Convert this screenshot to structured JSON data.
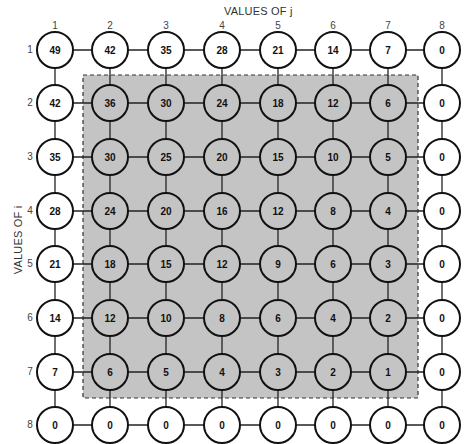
{
  "j_axis": {
    "title": "VALUES OF j",
    "ticks": [
      "1",
      "2",
      "3",
      "4",
      "5",
      "6",
      "7",
      "8"
    ]
  },
  "i_axis": {
    "title": "VALUES OF i",
    "ticks": [
      "1",
      "2",
      "3",
      "4",
      "5",
      "6",
      "7",
      "8"
    ]
  },
  "grid": [
    [
      "49",
      "42",
      "35",
      "28",
      "21",
      "14",
      "7",
      "0"
    ],
    [
      "42",
      "36",
      "30",
      "24",
      "18",
      "12",
      "6",
      "0"
    ],
    [
      "35",
      "30",
      "25",
      "20",
      "15",
      "10",
      "5",
      "0"
    ],
    [
      "28",
      "24",
      "20",
      "16",
      "12",
      "8",
      "4",
      "0"
    ],
    [
      "21",
      "18",
      "15",
      "12",
      "9",
      "6",
      "3",
      "0"
    ],
    [
      "14",
      "12",
      "10",
      "8",
      "6",
      "4",
      "2",
      "0"
    ],
    [
      "7",
      "6",
      "5",
      "4",
      "3",
      "2",
      "1",
      "0"
    ],
    [
      "0",
      "0",
      "0",
      "0",
      "0",
      "0",
      "0",
      "0"
    ]
  ],
  "shaded_region": {
    "rows": [
      2,
      7
    ],
    "cols": [
      2,
      7
    ],
    "fill": "#c4c4c4",
    "border": "dashed"
  },
  "colors": {
    "node_border": "#111111",
    "shaded_fill": "#c4c4c4",
    "background": "#ffffff"
  }
}
